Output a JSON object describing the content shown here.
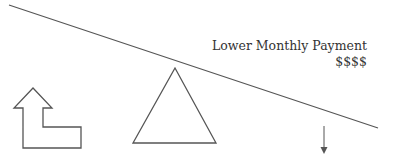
{
  "diagram": {
    "caption": "Lower Monthly Payment",
    "amount": "$$$$",
    "elements": [
      {
        "name": "balance-beam",
        "shape": "line",
        "description": "tilted beam sloping down to the right"
      },
      {
        "name": "fulcrum",
        "shape": "triangle"
      },
      {
        "name": "up-turn-arrow",
        "shape": "outlined L-shaped arrow pointing up"
      },
      {
        "name": "down-arrow",
        "shape": "small arrow pointing down"
      }
    ],
    "colors": {
      "stroke": "#555555",
      "text": "#333333",
      "background": "#ffffff"
    }
  }
}
